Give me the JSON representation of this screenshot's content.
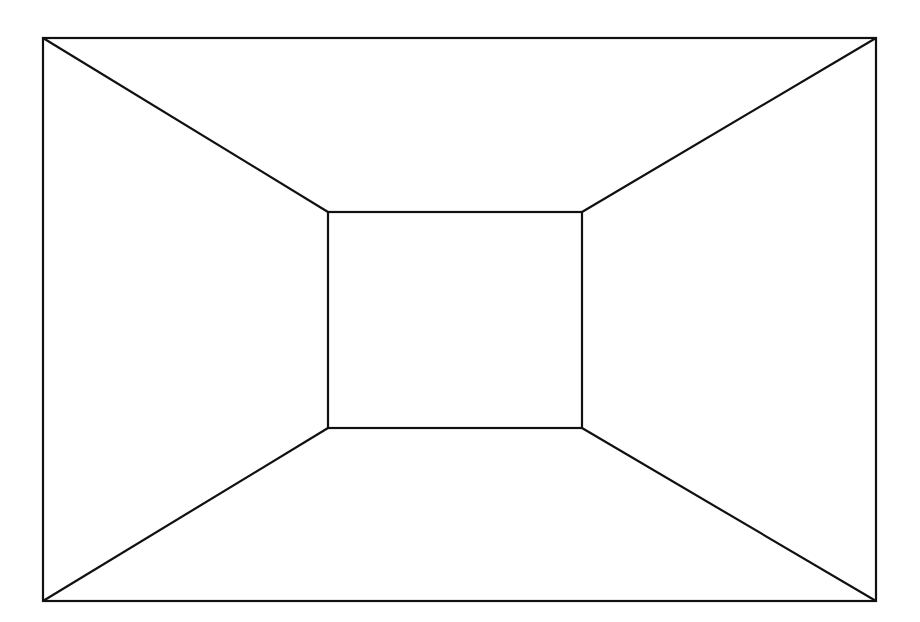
{
  "diagram": {
    "type": "one-point-perspective-room",
    "stroke_color": "#111111",
    "background": "#ffffff",
    "outer_rect": {
      "x1": 43,
      "y1": 38,
      "x2": 876,
      "y2": 601
    },
    "inner_rect": {
      "x1": 328,
      "y1": 212,
      "x2": 582,
      "y2": 428
    }
  }
}
